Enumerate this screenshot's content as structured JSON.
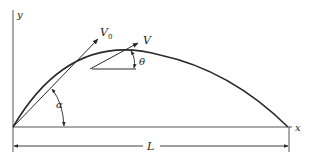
{
  "diagram": {
    "labels": {
      "y_axis": "y",
      "x_axis": "x",
      "initial_velocity": "V",
      "initial_velocity_sub": "0",
      "velocity": "V",
      "theta": "θ",
      "alpha": "α",
      "range": "L"
    },
    "colors": {
      "stroke": "#2a2a2a",
      "axis": "#555555",
      "background": "#ffffff"
    }
  }
}
